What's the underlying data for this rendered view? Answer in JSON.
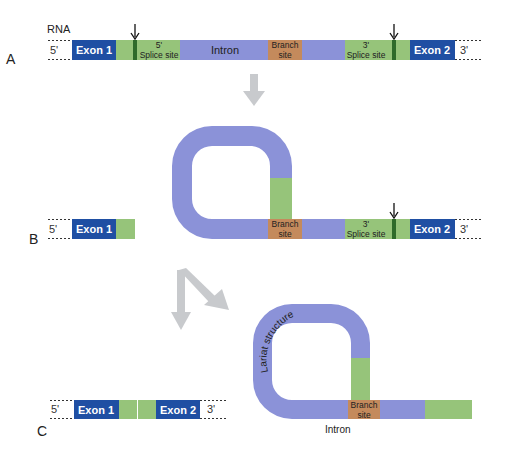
{
  "colors": {
    "exon": "#1f4fa3",
    "splice_site": "#96c47a",
    "splice_mark": "#2f6b2a",
    "intron": "#8b92d8",
    "branch": "#c48a5c",
    "process_arrow": "#c8cacd",
    "text_dark": "#222222",
    "text_light": "#ffffff"
  },
  "panels": {
    "A": {
      "panel_label": "A",
      "molecule_label": "RNA",
      "five_prime": "5'",
      "three_prime": "3'",
      "exon1": "Exon 1",
      "exon2": "Exon 2",
      "splice5_line1": "5'",
      "splice5_line2": "Splice site",
      "intron": "Intron",
      "branch_line1": "Branch",
      "branch_line2": "site",
      "splice3_line1": "3'",
      "splice3_line2": "Splice site"
    },
    "B": {
      "panel_label": "B",
      "five_prime": "5'",
      "three_prime": "3'",
      "exon1": "Exon 1",
      "exon2": "Exon 2",
      "branch_line1": "Branch",
      "branch_line2": "site",
      "splice3_line1": "3'",
      "splice3_line2": "Splice site"
    },
    "C": {
      "panel_label": "C",
      "five_prime": "5'",
      "three_prime": "3'",
      "exon1": "Exon 1",
      "exon2": "Exon 2",
      "lariat": "Lariat structure",
      "branch_line1": "Branch",
      "branch_line2": "site",
      "intron": "Intron"
    }
  }
}
